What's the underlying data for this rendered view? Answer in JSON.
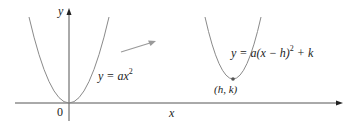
{
  "diagram": {
    "axes": {
      "x_label": "x",
      "y_label": "y",
      "origin_label": "0"
    },
    "curves": [
      {
        "name": "base-parabola",
        "label_pre": "y = ax",
        "label_exp": "2",
        "vertex": "origin"
      },
      {
        "name": "shifted-parabola",
        "label_pre": "y = a(x − h)",
        "label_exp": "2",
        "label_post": " + k",
        "vertex_label": "(h, k)"
      }
    ],
    "arrow": "translation-arrow",
    "colors": {
      "axis": "#333333",
      "curve": "#8a8a8a",
      "arrow": "#9a9a9a",
      "text": "#222222"
    }
  }
}
